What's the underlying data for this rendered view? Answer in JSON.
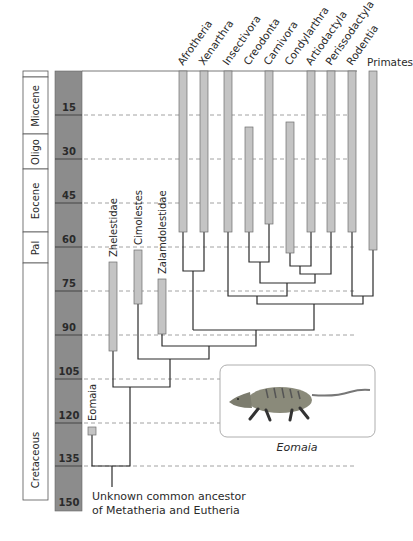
{
  "time_scale": {
    "unit": "millions of years ago",
    "ticks": [
      "15",
      "30",
      "45",
      "60",
      "75",
      "90",
      "105",
      "120",
      "135",
      "150"
    ],
    "column_color": "#8c8c8c"
  },
  "epochs": [
    {
      "label": ""
    },
    {
      "label": "Miocene"
    },
    {
      "label": "Oligo"
    },
    {
      "label": "Eocene"
    },
    {
      "label": "Pal"
    },
    {
      "label": "Cretaceous"
    }
  ],
  "modern_taxa": [
    {
      "label": "Afrotheria",
      "range": "0–60"
    },
    {
      "label": "Xenarthra",
      "range": "0–60"
    },
    {
      "label": "Insectivora",
      "range": "0–60"
    },
    {
      "label": "Creodonta",
      "range": "~10–62"
    },
    {
      "label": "Carnivora",
      "range": "0–58"
    },
    {
      "label": "Condylarthra",
      "range": "~8–68"
    },
    {
      "label": "Artiodactyla",
      "range": "0–60"
    },
    {
      "label": "Perissodactyla",
      "range": "0–60"
    },
    {
      "label": "Rodentia",
      "range": "0–60"
    },
    {
      "label": "Primates",
      "range": "0–72"
    }
  ],
  "fossil_taxa": [
    {
      "label": "Zhelestidae",
      "range": "~65–95"
    },
    {
      "label": "Cimolestes",
      "range": "~60–78"
    },
    {
      "label": "Zalamdolestidae",
      "range": "~70–88"
    },
    {
      "label": "Eomaia",
      "range": "~125"
    }
  ],
  "root_label_line1": "Unknown common ancestor",
  "root_label_line2": "of Metatheria and Eutheria",
  "illustration_caption": "Eomaia",
  "colors": {
    "bar_fill": "#c4c4c4",
    "bar_stroke": "#6e6e6e",
    "tree_line": "#2b2b2b",
    "dash_line": "#8a8a8a"
  }
}
